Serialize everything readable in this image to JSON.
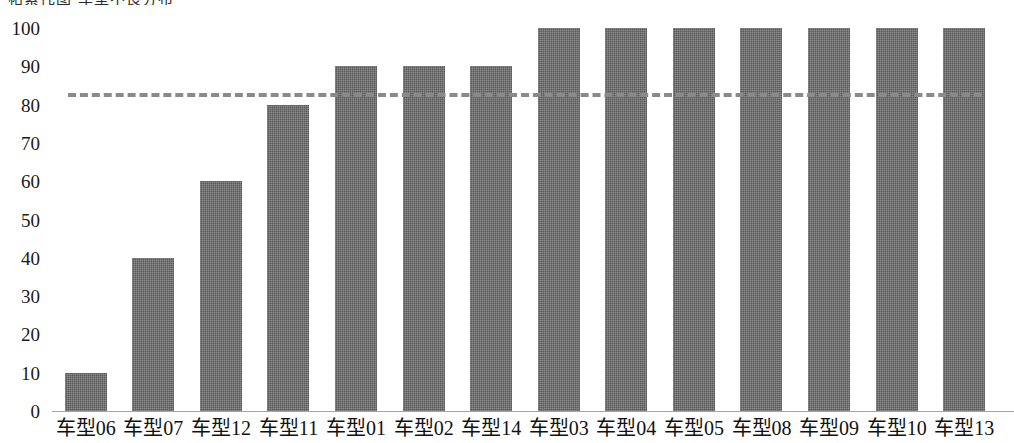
{
  "title_sliver": "帕累托图 车型不良分布",
  "chart_data": {
    "type": "bar",
    "title": "",
    "xlabel": "",
    "ylabel": "",
    "categories": [
      "车型06",
      "车型07",
      "车型12",
      "车型11",
      "车型01",
      "车型02",
      "车型14",
      "车型03",
      "车型04",
      "车型05",
      "车型08",
      "车型09",
      "车型10",
      "车型13"
    ],
    "values": [
      10,
      40,
      60,
      80,
      90,
      90,
      90,
      100,
      100,
      100,
      100,
      100,
      100,
      100
    ],
    "ylim": [
      0,
      100
    ],
    "yticks": [
      0,
      10,
      20,
      30,
      40,
      50,
      60,
      70,
      80,
      90,
      100
    ],
    "ytick_labels": [
      "0",
      "10",
      "20",
      "30",
      "40",
      "50",
      "60",
      "70",
      "80",
      "90",
      "100"
    ],
    "grid": false,
    "legend": "none",
    "bar_color": "#595959",
    "series": [
      {
        "name": "accumulated-percentage",
        "values": [
          10,
          40,
          60,
          80,
          90,
          90,
          90,
          100,
          100,
          100,
          100,
          100,
          100,
          100
        ]
      }
    ],
    "reference_line": {
      "name": "target-line",
      "value": 83,
      "style": "dashed",
      "color": "#8a8a8a",
      "orientation": "horizontal"
    }
  }
}
